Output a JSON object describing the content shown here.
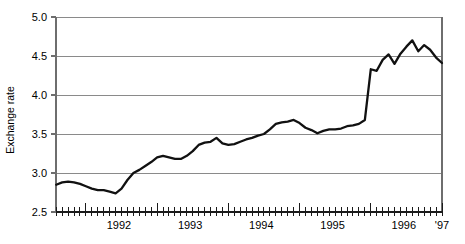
{
  "chart_data": {
    "type": "line",
    "title": "",
    "xlabel": "",
    "ylabel": "Exchange rate",
    "ylim": [
      2.5,
      5.0
    ],
    "yticks": [
      "2.5",
      "3.0",
      "3.5",
      "4.0",
      "4.5",
      "5.0"
    ],
    "ytick_values": [
      2.5,
      3.0,
      3.5,
      4.0,
      4.5,
      5.0
    ],
    "xlim": [
      1991.58,
      1997.0
    ],
    "xtick_labels": [
      "1992",
      "1993",
      "1994",
      "1995",
      "1996",
      "'97"
    ],
    "xtick_values": [
      1992.0,
      1993.0,
      1994.0,
      1995.0,
      1996.0,
      1997.0
    ],
    "grid": "horizontal",
    "legend": "none",
    "minor_tick_interval": "monthly",
    "series": [
      {
        "name": "Exchange rate",
        "color": "#111111",
        "x": [
          1991.583,
          1991.667,
          1991.75,
          1991.833,
          1991.917,
          1992.0,
          1992.083,
          1992.167,
          1992.25,
          1992.333,
          1992.417,
          1992.5,
          1992.583,
          1992.667,
          1992.75,
          1992.833,
          1992.917,
          1993.0,
          1993.083,
          1993.167,
          1993.25,
          1993.333,
          1993.417,
          1993.5,
          1993.583,
          1993.667,
          1993.75,
          1993.833,
          1993.917,
          1994.0,
          1994.083,
          1994.167,
          1994.25,
          1994.333,
          1994.417,
          1994.5,
          1994.583,
          1994.667,
          1994.75,
          1994.833,
          1994.917,
          1995.0,
          1995.083,
          1995.167,
          1995.25,
          1995.333,
          1995.417,
          1995.5,
          1995.583,
          1995.667,
          1995.75,
          1995.833,
          1995.917,
          1996.0,
          1996.083,
          1996.167,
          1996.25,
          1996.333,
          1996.417,
          1996.5,
          1996.583,
          1996.667,
          1996.75,
          1996.833,
          1996.917,
          1997.0
        ],
        "values": [
          2.85,
          2.88,
          2.89,
          2.88,
          2.86,
          2.83,
          2.8,
          2.78,
          2.78,
          2.76,
          2.74,
          2.8,
          2.91,
          3.0,
          3.04,
          3.09,
          3.14,
          3.2,
          3.22,
          3.2,
          3.18,
          3.18,
          3.22,
          3.28,
          3.36,
          3.39,
          3.4,
          3.45,
          3.38,
          3.36,
          3.37,
          3.4,
          3.43,
          3.45,
          3.48,
          3.5,
          3.56,
          3.63,
          3.65,
          3.66,
          3.68,
          3.64,
          3.58,
          3.55,
          3.51,
          3.54,
          3.56,
          3.56,
          3.57,
          3.6,
          3.61,
          3.63,
          3.68,
          3.66,
          3.63,
          3.64,
          3.65,
          3.66,
          3.65,
          3.64,
          3.64,
          3.78,
          3.98,
          4.22,
          4.33,
          4.35
        ]
      }
    ],
    "tail": {
      "x": [
        1996.0,
        1996.083,
        1996.167,
        1996.25,
        1996.333,
        1996.417,
        1996.5,
        1996.583,
        1996.667,
        1996.75,
        1996.833,
        1996.917,
        1997.0
      ],
      "values": [
        4.33,
        4.31,
        4.45,
        4.52,
        4.4,
        4.53,
        4.62,
        4.7,
        4.56,
        4.64,
        4.58,
        4.48,
        4.41
      ]
    }
  },
  "axes": {
    "y_axis_title": "Exchange rate"
  }
}
